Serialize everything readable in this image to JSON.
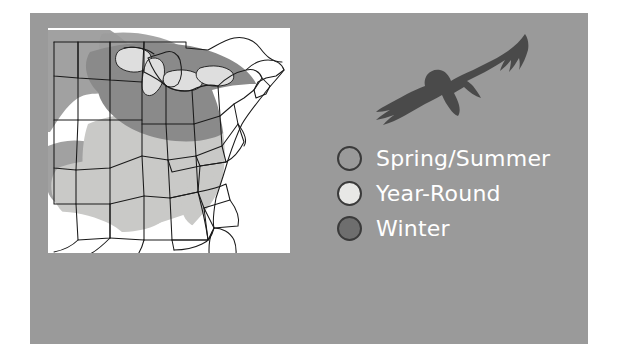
{
  "figure": {
    "kind": "bird-range-map",
    "background_color": "#ffffff",
    "panel_color": "#9a9a9a"
  },
  "map": {
    "name": "united-states-range-map",
    "card_background": "#ffffff",
    "region": "Eastern and Central United States",
    "border_color": "#1a1a1a",
    "shading": {
      "spring_summer_color": "#9a9a9a",
      "year_round_color": "#c8c8c6",
      "winter_color": "#8a8a8a",
      "no_range_color": "#ffffff"
    }
  },
  "bird": {
    "name": "eagle-silhouette",
    "color": "#4a4a4a",
    "description": "Soaring raptor silhouette with spread wings"
  },
  "legend": {
    "items": [
      {
        "label": "Spring/Summer",
        "swatch_color": "#9a9a9a",
        "outline_color": "#3a3a3a"
      },
      {
        "label": "Year-Round",
        "swatch_color": "#e8e8e6",
        "outline_color": "#3a3a3a"
      },
      {
        "label": "Winter",
        "swatch_color": "#6e6e6e",
        "outline_color": "#3a3a3a"
      }
    ],
    "text_color": "#ffffff"
  }
}
